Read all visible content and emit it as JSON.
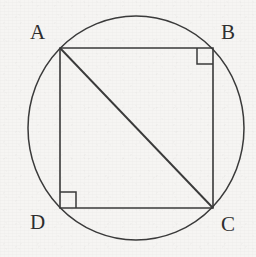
{
  "figure": {
    "stroke_color": "#3a3a3a",
    "background_color": "#f6f5f3",
    "label_color": "#2e2e2e",
    "circle": {
      "name": "circumscribed-circle",
      "center_x": 136,
      "center_y": 128,
      "radius_x": 108,
      "radius_y": 112
    },
    "rectangle": {
      "name": "rectangle-ABCD",
      "left": 60,
      "top": 48,
      "right": 213,
      "bottom": 208,
      "path": "M 60 48 L 213 48 L 213 208 L 60 208 Z"
    },
    "diagonal": {
      "name": "diagonal-AC",
      "x1": 60,
      "y1": 48,
      "x2": 213,
      "y2": 208
    },
    "right_angle_marks": [
      {
        "name": "right-angle-mark-B",
        "at_vertex": "B",
        "size": 16,
        "path": "M 197 48 L 197 64 L 213 64"
      },
      {
        "name": "right-angle-mark-D",
        "at_vertex": "D",
        "size": 16,
        "path": "M 60 192 L 76 192 L 76 208"
      }
    ],
    "vertices": [
      {
        "id": "A",
        "label": "A",
        "x": 60,
        "y": 48
      },
      {
        "id": "B",
        "label": "B",
        "x": 213,
        "y": 48
      },
      {
        "id": "C",
        "label": "C",
        "x": 213,
        "y": 208
      },
      {
        "id": "D",
        "label": "D",
        "x": 60,
        "y": 208
      }
    ]
  }
}
